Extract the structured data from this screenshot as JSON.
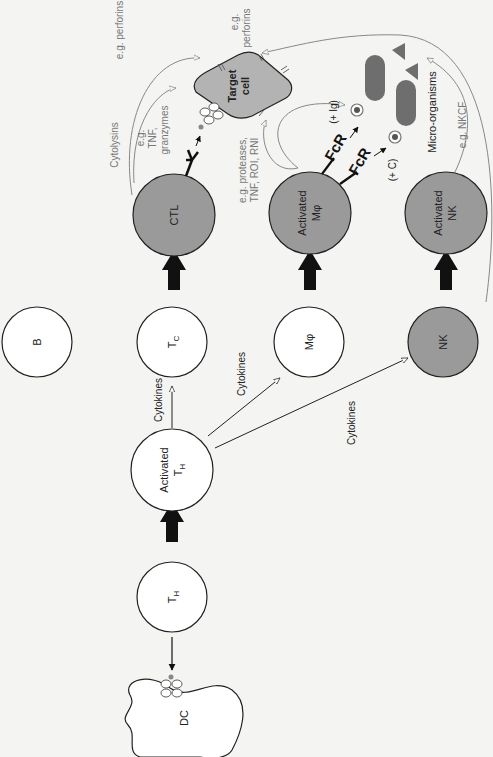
{
  "colors": {
    "background": "#f4f4f2",
    "cell_white": "#ffffff",
    "cell_activated": "#9a9a9a",
    "target_cell": "#b3b3b3",
    "microorganism": "#6e6e6e",
    "grey_arrow": "#888888",
    "black": "#111111"
  },
  "cells": {
    "dc": "DC",
    "th": "T",
    "th_sub": "H",
    "activated_th_line1": "Activated",
    "activated_th_line2": "T",
    "activated_th_sub": "H",
    "b": "B",
    "tc": "T",
    "tc_sub": "C",
    "mphi": "Mφ",
    "nk": "NK",
    "ctl": "CTL",
    "activated_mphi_line1": "Activated",
    "activated_mphi_line2": "Mφ",
    "activated_nk_line1": "Activated",
    "activated_nk_line2": "NK",
    "target_line1": "Target",
    "target_line2": "cell"
  },
  "labels": {
    "cytokines_tc": "Cytokines",
    "cytokines_mphi": "Cytokines",
    "cytokines_nk": "Cytokines",
    "cytolysins": "Cytolysins",
    "eg_perforins_ctl": "e.g. perforins",
    "eg_tnf_granzymes_1": "e.g.",
    "eg_tnf_granzymes_2": "TNF,",
    "eg_tnf_granzymes_3": "granzymes",
    "eg_perforins_nk_1": "e.g.",
    "eg_perforins_nk_2": "perforins",
    "eg_proteases_1": "e.g. proteases,",
    "eg_proteases_2": "TNF, ROI, RNI",
    "plus_ig": "(+ Ig)",
    "plus_c": "(+ C)",
    "micro_organisms": "Micro-organisms",
    "eg_nkcf": "e.g. NKCF",
    "fcr": "FcR"
  }
}
